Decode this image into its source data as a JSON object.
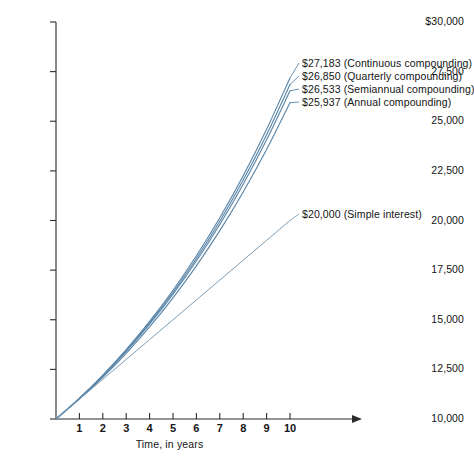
{
  "chart_data": {
    "type": "line",
    "title": "",
    "xlabel": "Time, in years",
    "ylabel": "",
    "xlim": [
      0,
      10
    ],
    "ylim": [
      10000,
      30000
    ],
    "grid": false,
    "legend_position": "inline-annotations",
    "x_ticks": [
      "1",
      "2",
      "3",
      "4",
      "5",
      "6",
      "7",
      "8",
      "9",
      "10"
    ],
    "x_tick_values": [
      1,
      2,
      3,
      4,
      5,
      6,
      7,
      8,
      9,
      10
    ],
    "y_ticks": [
      "$30,000",
      "27,500",
      "25,000",
      "22,500",
      "20,000",
      "17,500",
      "15,000",
      "12,500",
      "10,000"
    ],
    "y_tick_values": [
      30000,
      27500,
      25000,
      22500,
      20000,
      17500,
      15000,
      12500,
      10000
    ],
    "x": [
      0,
      1,
      2,
      3,
      4,
      5,
      6,
      7,
      8,
      9,
      10
    ],
    "series": [
      {
        "name": "Continuous compounding",
        "end_value": 27183,
        "end_label": "$27,183 (Continuous compounding)",
        "color": "#5b86a8",
        "values": [
          10000,
          11052,
          12214,
          13499,
          14918,
          16487,
          18221,
          20138,
          22255,
          24596,
          27183
        ]
      },
      {
        "name": "Quarterly compounding",
        "end_value": 26850,
        "end_label": "$26,850 (Quarterly compounding)",
        "color": "#5b86a8",
        "values": [
          10000,
          11038,
          12184,
          13449,
          14845,
          16386,
          18087,
          19965,
          22038,
          24325,
          26850
        ]
      },
      {
        "name": "Semiannual compounding",
        "end_value": 26533,
        "end_label": "$26,533 (Semiannual compounding)",
        "color": "#5b86a8",
        "values": [
          10000,
          11025,
          12155,
          13401,
          14775,
          16289,
          17959,
          19799,
          21829,
          24066,
          26533
        ]
      },
      {
        "name": "Annual compounding",
        "end_value": 25937,
        "end_label": "$25,937 (Annual compounding)",
        "color": "#5b86a8",
        "values": [
          10000,
          11000,
          12100,
          13310,
          14641,
          16105,
          17716,
          19487,
          21436,
          23579,
          25937
        ]
      },
      {
        "name": "Simple interest",
        "end_value": 20000,
        "end_label": "$20,000 (Simple interest)",
        "color": "#7d9db5",
        "values": [
          10000,
          11000,
          12000,
          13000,
          14000,
          15000,
          16000,
          17000,
          18000,
          19000,
          20000
        ]
      }
    ],
    "annotations": [
      "$27,183 (Continuous compounding)",
      "$26,850 (Quarterly compounding)",
      "$26,533 (Semiannual compounding)",
      "$25,937 (Annual compounding)",
      "$20,000 (Simple interest)"
    ]
  },
  "axes": {
    "x_axis_label": "Time, in years",
    "y_axis_top_label": "$30,000"
  },
  "colors": {
    "curve": "#5b86a8",
    "simple_line": "#7d9db5",
    "axis": "#2b2b2b",
    "text": "#141414",
    "background": "#ffffff"
  }
}
